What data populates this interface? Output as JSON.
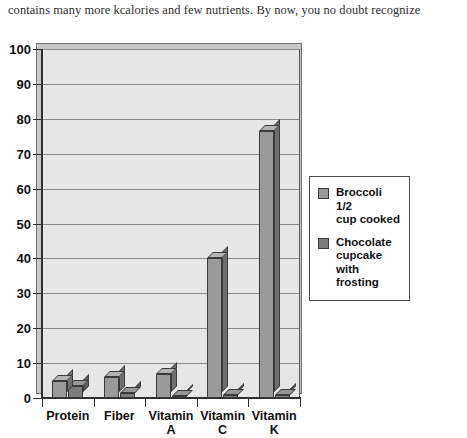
{
  "caption": {
    "text": "contains many more kcalories and few nutrients. By now, you no doubt recognize"
  },
  "chart_data": {
    "type": "bar",
    "title": "",
    "subtitle": "",
    "xlabel": "",
    "ylabel": "",
    "categories": [
      "Protein",
      "Fiber",
      "Vitamin\nA",
      "Vitamin\nC",
      "Vitamin\nK"
    ],
    "category_labels": [
      {
        "line1": "Protein",
        "line2": ""
      },
      {
        "line1": "Fiber",
        "line2": ""
      },
      {
        "line1": "Vitamin",
        "line2": "A"
      },
      {
        "line1": "Vitamin",
        "line2": "C"
      },
      {
        "line1": "Vitamin",
        "line2": "K"
      }
    ],
    "series": [
      {
        "name": "Broccoli 1/2 cup cooked",
        "name_lines": [
          "Broccoli 1/2",
          "cup cooked"
        ],
        "color": "#9a9a9a",
        "top_color": "#b4b4b4",
        "side_color": "#6f6f6f",
        "values": [
          5,
          6,
          7,
          40,
          76.5
        ]
      },
      {
        "name": "Chocolate cupcake with frosting",
        "name_lines": [
          "Chocolate",
          "cupcake with",
          "frosting"
        ],
        "color": "#7d7d7d",
        "top_color": "#969696",
        "side_color": "#5a5a5a",
        "values": [
          3.5,
          1.5,
          0.5,
          1,
          1
        ]
      }
    ],
    "ylim": [
      0,
      100
    ],
    "ytick_step": 10,
    "yticks": [
      0,
      10,
      20,
      30,
      40,
      50,
      60,
      70,
      80,
      90,
      100
    ],
    "grid": true,
    "legend_position": "right",
    "plot_background": "#e6e6e6",
    "style_3d": true
  },
  "legend": {
    "entries": [
      {
        "label_line1": "Broccoli 1/2",
        "label_line2": "cup cooked",
        "label_line3": ""
      },
      {
        "label_line1": "Chocolate",
        "label_line2": "cupcake with",
        "label_line3": "frosting"
      }
    ]
  }
}
